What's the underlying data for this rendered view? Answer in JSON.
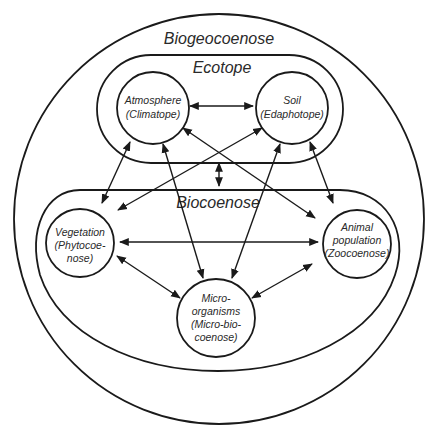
{
  "diagram": {
    "regions": {
      "biogeocoenose": {
        "label": "Biogeocoenose"
      },
      "ecotope": {
        "label": "Ecotope"
      },
      "biocoenose": {
        "label": "Biocoenose"
      }
    },
    "nodes": {
      "atmosphere": {
        "line1": "Atmosphere",
        "line2": "(Climatope)"
      },
      "soil": {
        "line1": "Soil",
        "line2": "(Edaphotope)"
      },
      "vegetation": {
        "line1": "Vegetation",
        "line2": "(Phytocoe-",
        "line3": "nose)"
      },
      "animal": {
        "line1": "Animal",
        "line2": "population",
        "line3": "(Zoocoenose)"
      },
      "micro": {
        "line1": "Micro-",
        "line2": "organisms",
        "line3": "(Micro-bio-",
        "line4": "coenose)"
      }
    },
    "edges": [
      {
        "from": "Atmosphere",
        "to": "Soil",
        "type": "bidirectional"
      },
      {
        "from": "Ecotope",
        "to": "Biocoenose",
        "type": "bidirectional"
      },
      {
        "from": "Atmosphere",
        "to": "Vegetation",
        "type": "bidirectional"
      },
      {
        "from": "Atmosphere",
        "to": "Micro-organisms",
        "type": "bidirectional"
      },
      {
        "from": "Atmosphere",
        "to": "Animal population",
        "type": "bidirectional"
      },
      {
        "from": "Soil",
        "to": "Vegetation",
        "type": "bidirectional"
      },
      {
        "from": "Soil",
        "to": "Micro-organisms",
        "type": "bidirectional"
      },
      {
        "from": "Soil",
        "to": "Animal population",
        "type": "bidirectional"
      },
      {
        "from": "Vegetation",
        "to": "Animal population",
        "type": "bidirectional"
      },
      {
        "from": "Vegetation",
        "to": "Micro-organisms",
        "type": "bidirectional"
      },
      {
        "from": "Animal population",
        "to": "Micro-organisms",
        "type": "bidirectional"
      }
    ],
    "colors": {
      "stroke": "#1a1a1a",
      "text": "#2a2a2a",
      "background": "#ffffff"
    }
  }
}
